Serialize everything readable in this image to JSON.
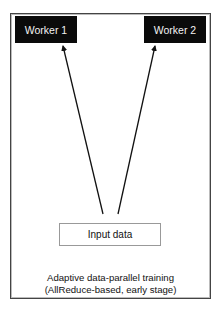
{
  "diagram": {
    "nodes": {
      "worker1": {
        "label": "Worker 1"
      },
      "worker2": {
        "label": "Worker 2"
      },
      "input": {
        "label": "Input data"
      }
    },
    "edges": [
      {
        "from": "input",
        "to": "worker1"
      },
      {
        "from": "input",
        "to": "worker2"
      }
    ],
    "caption": {
      "line1": "Adaptive data-parallel training",
      "line2": "(AllReduce-based, early stage)"
    },
    "colors": {
      "worker_fill": "#0a0a0a",
      "worker_text": "#f2f2f2",
      "arrow": "#111111",
      "frame": "#444444"
    }
  }
}
